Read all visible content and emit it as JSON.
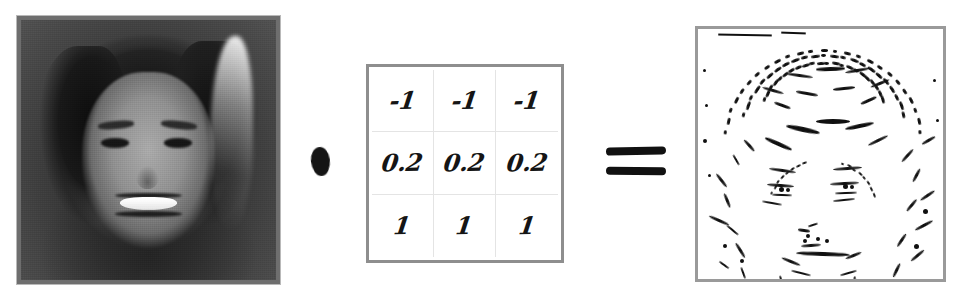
{
  "figure": {
    "background_color": "#ffffff"
  },
  "input_image": {
    "name": "input-photo",
    "description": "Grayscale photograph of a smiling woman with long hair",
    "alt": "portrait photograph, grayscale",
    "border_color": "#b9b9b9"
  },
  "convolution_operator": {
    "symbol": "●",
    "name": "convolution-dot",
    "color": "#141414"
  },
  "kernel": {
    "name": "convolution-kernel",
    "rows": 3,
    "cols": 3,
    "border_color": "#8e8e8e",
    "grid_line_color": "#e4e4e4",
    "values": [
      [
        "-1",
        "-1",
        "-1"
      ],
      [
        "0.2",
        "0.2",
        "0.2"
      ],
      [
        "1",
        "1",
        "1"
      ]
    ],
    "flat_values": [
      "-1",
      "-1",
      "-1",
      "0.2",
      "0.2",
      "0.2",
      "1",
      "1",
      "1"
    ]
  },
  "equals_operator": {
    "symbol": "=",
    "name": "equals-sign",
    "color": "#111111"
  },
  "output_image": {
    "name": "output-edge-map",
    "description": "Binary edge map of the portrait produced by the convolution",
    "alt": "black and white edge detection result",
    "border_color": "#9a9a9a"
  }
}
